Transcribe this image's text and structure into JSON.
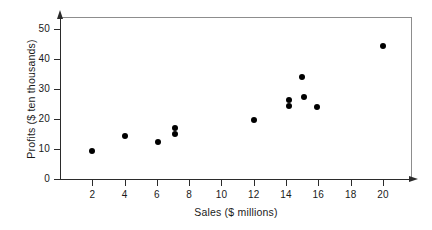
{
  "chart_data": {
    "type": "scatter",
    "title": "",
    "xlabel": "Sales ($ millions)",
    "ylabel": "Profits ($ ten thousands)",
    "xlim": [
      0,
      21.8
    ],
    "ylim": [
      0,
      54
    ],
    "grid": false,
    "legend": null,
    "xticks": [
      2,
      4,
      6,
      8,
      10,
      12,
      14,
      16,
      18,
      20
    ],
    "yticks": [
      0,
      10,
      20,
      30,
      40,
      50
    ],
    "xtick_labels": [
      "2",
      "4",
      "6",
      "8",
      "10",
      "12",
      "14",
      "16",
      "18",
      "20"
    ],
    "ytick_labels": [
      "0",
      "10",
      "20",
      "30",
      "40",
      "50"
    ],
    "marker": "filled-circle",
    "marker_color": "#000000",
    "points": [
      {
        "x": 2.0,
        "y": 9.5
      },
      {
        "x": 4.0,
        "y": 14.5
      },
      {
        "x": 6.1,
        "y": 12.5
      },
      {
        "x": 7.1,
        "y": 17.0
      },
      {
        "x": 7.1,
        "y": 15.0
      },
      {
        "x": 12.0,
        "y": 19.8
      },
      {
        "x": 14.2,
        "y": 26.3
      },
      {
        "x": 14.2,
        "y": 24.5
      },
      {
        "x": 15.0,
        "y": 34.0
      },
      {
        "x": 15.1,
        "y": 27.5
      },
      {
        "x": 15.9,
        "y": 24.0
      },
      {
        "x": 20.0,
        "y": 44.5
      }
    ]
  },
  "colors": {
    "axis": "#2b2b2b",
    "frame": "#8d8d8d",
    "text": "#1a1a1a",
    "background": "#ffffff",
    "marker": "#000000"
  }
}
